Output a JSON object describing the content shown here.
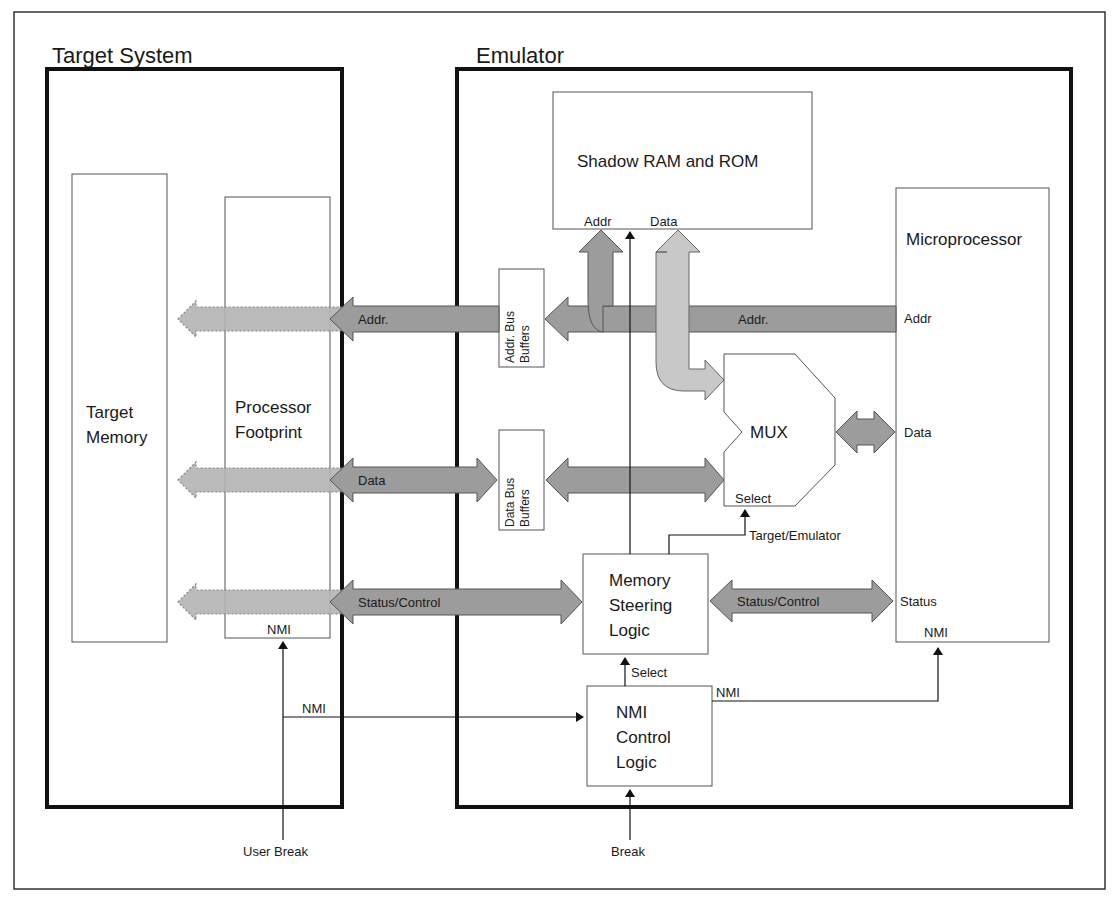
{
  "sections": {
    "target_system": "Target System",
    "emulator": "Emulator"
  },
  "blocks": {
    "target_memory": [
      "Target",
      "Memory"
    ],
    "processor_footprint": [
      "Processor",
      "Footprint"
    ],
    "processor_footprint_pin": "NMI",
    "shadow_ram_rom": "Shadow RAM and ROM",
    "shadow_addr_port": "Addr",
    "shadow_data_port": "Data",
    "addr_bus_buffers": [
      "Addr. Bus",
      "Buffers"
    ],
    "data_bus_buffers": [
      "Data Bus",
      "Buffers"
    ],
    "mux": "MUX",
    "mux_select": "Select",
    "microprocessor": "Microprocessor",
    "micro_pins": {
      "addr": "Addr",
      "data": "Data",
      "status": "Status",
      "nmi": "NMI"
    },
    "memory_steering_logic": [
      "Memory",
      "Steering",
      "Logic"
    ],
    "nmi_control_logic": [
      "NMI",
      "Control",
      "Logic"
    ]
  },
  "buses": {
    "addr_left": "Addr.",
    "addr_right": "Addr.",
    "data_left": "Data",
    "status_left": "Status/Control",
    "status_right": "Status/Control"
  },
  "signals": {
    "target_emulator": "Target/Emulator",
    "select": "Select",
    "nmi_to_micro": "NMI",
    "nmi_from_user": "NMI",
    "user_break": "User Break",
    "break": "Break"
  },
  "colors": {
    "bus_dark": "#9c9c9c",
    "bus_light": "#c8c8c8",
    "border": "#111111"
  }
}
